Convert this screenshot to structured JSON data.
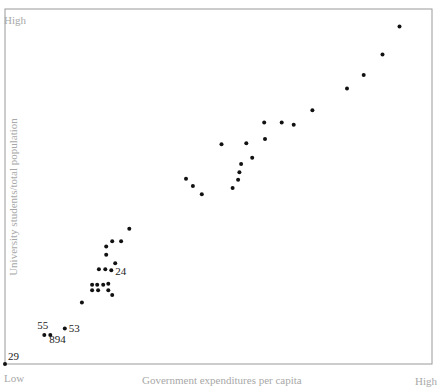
{
  "chart_data": {
    "type": "scatter",
    "title": "",
    "xlabel": "Government expenditures per capita",
    "ylabel": "University students/total population",
    "x_ticks": {
      "low": "Low",
      "high": "High"
    },
    "y_ticks": {
      "low": "Low",
      "high": "High"
    },
    "xlim": [
      0,
      100
    ],
    "ylim": [
      0,
      100
    ],
    "grid": false,
    "legend": null,
    "points": [
      {
        "x": 0.0,
        "y": 0.0,
        "label": "29"
      },
      {
        "x": 9.2,
        "y": 8.2,
        "label": "55"
      },
      {
        "x": 10.6,
        "y": 8.2,
        "label": "894"
      },
      {
        "x": 14.0,
        "y": 10.0,
        "label": "53"
      },
      {
        "x": 18.0,
        "y": 17.3,
        "label": ""
      },
      {
        "x": 20.4,
        "y": 22.3,
        "label": ""
      },
      {
        "x": 21.6,
        "y": 22.3,
        "label": ""
      },
      {
        "x": 23.0,
        "y": 22.3,
        "label": ""
      },
      {
        "x": 24.2,
        "y": 22.6,
        "label": ""
      },
      {
        "x": 20.4,
        "y": 20.8,
        "label": ""
      },
      {
        "x": 21.8,
        "y": 20.8,
        "label": ""
      },
      {
        "x": 24.2,
        "y": 20.8,
        "label": ""
      },
      {
        "x": 25.1,
        "y": 19.4,
        "label": ""
      },
      {
        "x": 22.0,
        "y": 26.7,
        "label": ""
      },
      {
        "x": 23.5,
        "y": 26.7,
        "label": ""
      },
      {
        "x": 24.9,
        "y": 26.4,
        "label": "24"
      },
      {
        "x": 25.8,
        "y": 28.4,
        "label": ""
      },
      {
        "x": 23.7,
        "y": 30.8,
        "label": ""
      },
      {
        "x": 23.7,
        "y": 33.1,
        "label": ""
      },
      {
        "x": 25.1,
        "y": 34.6,
        "label": ""
      },
      {
        "x": 27.2,
        "y": 34.6,
        "label": ""
      },
      {
        "x": 29.1,
        "y": 38.1,
        "label": ""
      },
      {
        "x": 42.4,
        "y": 52.2,
        "label": ""
      },
      {
        "x": 44.0,
        "y": 50.1,
        "label": ""
      },
      {
        "x": 46.1,
        "y": 47.8,
        "label": ""
      },
      {
        "x": 50.7,
        "y": 61.9,
        "label": ""
      },
      {
        "x": 53.3,
        "y": 49.6,
        "label": ""
      },
      {
        "x": 54.6,
        "y": 51.9,
        "label": ""
      },
      {
        "x": 54.9,
        "y": 54.0,
        "label": ""
      },
      {
        "x": 55.3,
        "y": 56.3,
        "label": ""
      },
      {
        "x": 57.9,
        "y": 58.1,
        "label": ""
      },
      {
        "x": 56.5,
        "y": 62.2,
        "label": ""
      },
      {
        "x": 60.7,
        "y": 68.0,
        "label": ""
      },
      {
        "x": 60.9,
        "y": 63.4,
        "label": ""
      },
      {
        "x": 64.8,
        "y": 68.0,
        "label": ""
      },
      {
        "x": 67.6,
        "y": 67.4,
        "label": ""
      },
      {
        "x": 72.0,
        "y": 71.5,
        "label": ""
      },
      {
        "x": 80.1,
        "y": 77.6,
        "label": ""
      },
      {
        "x": 84.0,
        "y": 81.4,
        "label": ""
      },
      {
        "x": 88.4,
        "y": 87.2,
        "label": ""
      },
      {
        "x": 92.4,
        "y": 95.1,
        "label": ""
      }
    ]
  },
  "plot": {
    "axis_color": "#9a9a9a",
    "point_color": "#111111"
  }
}
